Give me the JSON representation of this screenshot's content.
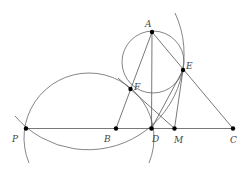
{
  "figure": {
    "type": "geometry-diagram",
    "points": {
      "A": {
        "label": "A",
        "x": 152,
        "y": 32,
        "lx": 147,
        "ly": 26
      },
      "E": {
        "label": "E",
        "x": 183,
        "y": 70,
        "lx": 186,
        "ly": 69
      },
      "F": {
        "label": "F",
        "x": 130.5,
        "y": 89,
        "lx": 134,
        "ly": 90
      },
      "P": {
        "label": "P",
        "x": 26,
        "y": 128.5,
        "lx": 12,
        "ly": 142
      },
      "B": {
        "label": "B",
        "x": 116,
        "y": 128.5,
        "lx": 104,
        "ly": 142
      },
      "D": {
        "label": "D",
        "x": 151.5,
        "y": 128.5,
        "lx": 152,
        "ly": 142
      },
      "M": {
        "label": "M",
        "x": 174.5,
        "y": 128.5,
        "lx": 174,
        "ly": 143
      },
      "C": {
        "label": "C",
        "x": 233,
        "y": 128.5,
        "lx": 230,
        "ly": 143
      }
    },
    "segments": [
      [
        "P",
        "C"
      ],
      [
        "A",
        "D"
      ],
      [
        "A",
        "B"
      ],
      [
        "A",
        "C"
      ],
      [
        "D",
        "E"
      ],
      [
        "M",
        "E"
      ],
      [
        "F",
        "M"
      ]
    ],
    "circles": [
      {
        "name": "circle-through-A-E-F",
        "cx": 153,
        "cy": 62,
        "r": 31
      },
      {
        "name": "circle-through-P-F-D",
        "cx": 89,
        "cy": 138,
        "r": 65
      },
      {
        "name": "circle-through-P-D-E",
        "cx": 88.5,
        "cy": 54.6,
        "r": 96
      }
    ]
  }
}
